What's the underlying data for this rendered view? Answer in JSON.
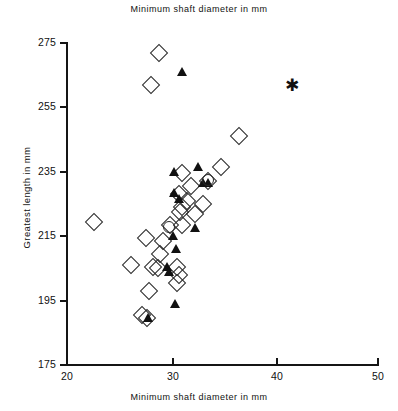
{
  "chart_data": {
    "type": "scatter",
    "title": "Minimum shaft diameter in mm",
    "subtitle": "Minimum shaft diameter in mm",
    "xlabel": "Minimum shaft diameter in mm",
    "ylabel": "Greatest length in mm",
    "xlim": [
      20,
      50
    ],
    "ylim": [
      175,
      275
    ],
    "xticks": [
      20,
      30,
      40,
      50
    ],
    "yticks": [
      175,
      195,
      215,
      235,
      255,
      275
    ],
    "xtick_labels": [
      "20",
      "30",
      "40",
      "50"
    ],
    "ytick_labels": [
      "175",
      "195",
      "215",
      "235",
      "255",
      "275"
    ],
    "grid": false,
    "legend": "none",
    "series": [
      {
        "name": "open-diamond",
        "marker": "diamond",
        "points": [
          [
            28.9,
            272.0
          ],
          [
            28.1,
            262.0
          ],
          [
            36.6,
            246.0
          ],
          [
            34.9,
            236.5
          ],
          [
            31.1,
            234.5
          ],
          [
            33.6,
            232.0
          ],
          [
            32.0,
            230.5
          ],
          [
            30.8,
            228.0
          ],
          [
            31.6,
            226.0
          ],
          [
            33.1,
            225.0
          ],
          [
            31.1,
            224.0
          ],
          [
            30.9,
            222.5
          ],
          [
            32.3,
            222.0
          ],
          [
            22.6,
            219.5
          ],
          [
            29.9,
            218.5
          ],
          [
            31.1,
            218.5
          ],
          [
            27.6,
            214.5
          ],
          [
            29.3,
            213.5
          ],
          [
            29.0,
            209.5
          ],
          [
            26.2,
            206.0
          ],
          [
            28.3,
            205.5
          ],
          [
            28.8,
            205.0
          ],
          [
            30.6,
            205.5
          ],
          [
            30.8,
            203.0
          ],
          [
            30.6,
            200.5
          ],
          [
            27.9,
            198.0
          ],
          [
            27.2,
            190.5
          ],
          [
            27.7,
            189.5
          ]
        ]
      },
      {
        "name": "filled-triangle",
        "marker": "triangle",
        "points": [
          [
            31.1,
            266.0
          ],
          [
            30.3,
            235.0
          ],
          [
            32.6,
            236.5
          ],
          [
            33.1,
            231.5
          ],
          [
            33.6,
            231.5
          ],
          [
            30.3,
            228.5
          ],
          [
            30.8,
            226.5
          ],
          [
            32.3,
            217.5
          ],
          [
            30.2,
            215.0
          ],
          [
            30.5,
            211.0
          ],
          [
            29.6,
            205.5
          ],
          [
            29.8,
            204.0
          ],
          [
            30.4,
            194.0
          ],
          [
            27.8,
            189.5
          ]
        ]
      },
      {
        "name": "open-circle",
        "marker": "circle",
        "points": [
          [
            33.6,
            232.5
          ],
          [
            29.8,
            218.0
          ]
        ]
      },
      {
        "name": "asterisk",
        "marker": "star",
        "points": [
          [
            41.7,
            262.0
          ]
        ]
      }
    ]
  },
  "axes": {
    "y_tick_275": "275",
    "y_tick_255": "255",
    "y_tick_235": "235",
    "y_tick_215": "215",
    "y_tick_195": "195",
    "y_tick_175": "175",
    "x_tick_20": "20",
    "x_tick_30": "30",
    "x_tick_40": "40",
    "x_tick_50": "50"
  }
}
